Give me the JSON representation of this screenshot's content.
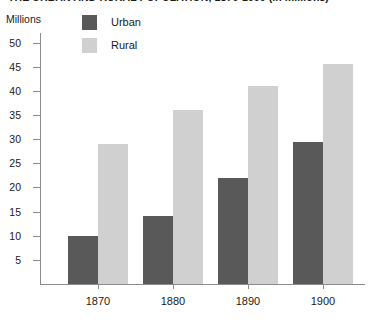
{
  "chart_data": {
    "type": "bar",
    "title": "THE URBAN AND RURAL POPULATION, 1870-1900 (in millions)",
    "xlabel": "",
    "ylabel": "Millions",
    "ylim": [
      0,
      52
    ],
    "yticks": [
      5,
      10,
      15,
      20,
      25,
      30,
      35,
      40,
      45,
      50
    ],
    "ytick_labels": [
      "5",
      "10",
      "15",
      "20",
      "25",
      "30",
      "35",
      "40",
      "45",
      "50"
    ],
    "grid": false,
    "legend_position": "top-left",
    "categories": [
      "1870",
      "1880",
      "1890",
      "1900"
    ],
    "series": [
      {
        "name": "Urban",
        "color": "#595959",
        "values": [
          10,
          14,
          22,
          29.5
        ]
      },
      {
        "name": "Rural",
        "color": "#d0d0d0",
        "values": [
          29,
          36,
          41,
          45.5
        ]
      }
    ]
  },
  "legend": {
    "items": [
      {
        "label": "Urban",
        "color": "#595959"
      },
      {
        "label": "Rural",
        "color": "#d0d0d0"
      }
    ]
  },
  "axis": {
    "unit_caption": "Millions"
  },
  "colors": {
    "urban": "#595959",
    "rural": "#d0d0d0",
    "axis": "#8c8c8c",
    "text": "#1a1a1a",
    "background": "#ffffff"
  }
}
